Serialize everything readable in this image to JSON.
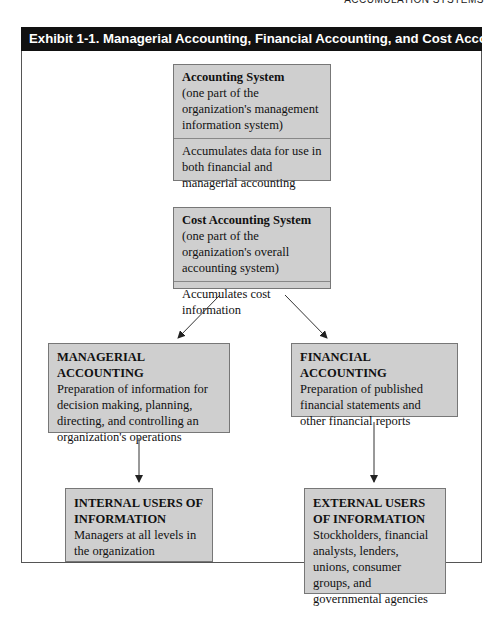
{
  "running_header": "ACCUMULATION SYSTEMS",
  "exhibit": {
    "title": "Exhibit 1-1. Managerial Accounting, Financial Accounting, and Cost Accounting"
  },
  "nodes": {
    "accounting_system": {
      "title": "Accounting System",
      "subtitle": "(one part of the organization's management information system)",
      "description": "Accumulates data for use in both financial and managerial accounting"
    },
    "cost_accounting_system": {
      "title": "Cost Accounting System",
      "subtitle": "(one part of the organization's overall accounting system)",
      "description": "Accumulates cost information"
    },
    "managerial_accounting": {
      "title": "MANAGERIAL ACCOUNTING",
      "description": "Preparation of information for decision making, planning, directing, and controlling an organization's operations"
    },
    "financial_accounting": {
      "title": "FINANCIAL ACCOUNTING",
      "description": "Preparation of published financial statements and other financial reports"
    },
    "internal_users": {
      "title": "INTERNAL USERS OF INFORMATION",
      "description": "Managers at all levels in the organization"
    },
    "external_users": {
      "title": "EXTERNAL USERS OF INFORMATION",
      "description": "Stockholders, financial analysts, lenders, unions, consumer groups, and governmental agencies"
    }
  },
  "edges": [
    {
      "from": "cost_accounting_system",
      "to": "managerial_accounting"
    },
    {
      "from": "cost_accounting_system",
      "to": "financial_accounting"
    },
    {
      "from": "managerial_accounting",
      "to": "internal_users"
    },
    {
      "from": "financial_accounting",
      "to": "external_users"
    }
  ],
  "colors": {
    "title_bar": "#111111",
    "box_fill": "#cfcfcf",
    "box_border": "#777777"
  }
}
